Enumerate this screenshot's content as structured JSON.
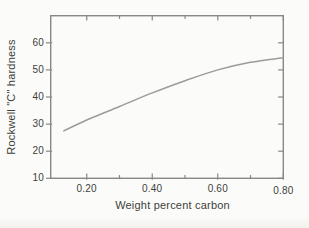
{
  "figure": {
    "background": "#fbfbf9",
    "axis_color": "#878a81",
    "curve_color": "#9b9d95",
    "text_color": "#3d3f3b"
  },
  "chart_data": {
    "type": "line",
    "title": "",
    "xlabel": "Weight percent carbon",
    "ylabel": "Rockwell \"C\" hardness",
    "xlim": [
      0.09,
      0.8
    ],
    "ylim": [
      10,
      70
    ],
    "grid": false,
    "legend": "none",
    "x_major_ticks": [
      0.2,
      0.4,
      0.6,
      0.8
    ],
    "x_minor_ticks": [
      0.3,
      0.5,
      0.7
    ],
    "x_tick_labels": [
      "0.20",
      "0.40",
      "0.60",
      "0.80"
    ],
    "y_major_ticks": [
      60,
      50,
      40,
      30,
      20,
      10
    ],
    "y_tick_labels": [
      "60",
      "50",
      "40",
      "30",
      "20",
      "10"
    ],
    "series": [
      {
        "name": "hardness-vs-carbon-curve",
        "x": [
          0.13,
          0.2,
          0.3,
          0.4,
          0.5,
          0.6,
          0.7,
          0.8
        ],
        "y": [
          27.5,
          31.5,
          36.5,
          41.5,
          46.0,
          50.0,
          52.8,
          54.5
        ]
      }
    ]
  }
}
